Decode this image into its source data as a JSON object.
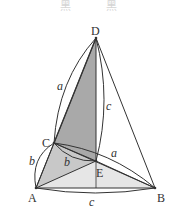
{
  "header": {
    "fragments": [
      "黑",
      "黑"
    ]
  },
  "figure": {
    "points": {
      "A": {
        "label": "A",
        "x": 36,
        "y": 188
      },
      "B": {
        "label": "B",
        "x": 155,
        "y": 188
      },
      "C": {
        "label": "C",
        "x": 54,
        "y": 143
      },
      "D": {
        "label": "D",
        "x": 96,
        "y": 38
      },
      "E": {
        "label": "E",
        "x": 96,
        "y": 161
      }
    },
    "edge_labels": {
      "DC": "a",
      "DE": "c",
      "AC": "b",
      "CE": "b",
      "EB": "a",
      "AB": "c"
    },
    "colors": {
      "line": "#333333",
      "dark_fill": "#a9a9a9",
      "mid_fill": "#c8c8c8",
      "light_fill": "#e6e6e6",
      "background": "#ffffff"
    }
  }
}
